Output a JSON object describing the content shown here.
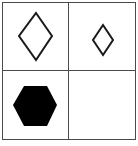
{
  "puzzle": {
    "layout": "2x2 grid",
    "cells": [
      {
        "position": "top-left",
        "shape": "diamond",
        "fill": "none",
        "size": "large"
      },
      {
        "position": "top-right",
        "shape": "diamond",
        "fill": "none",
        "size": "small"
      },
      {
        "position": "bottom-left",
        "shape": "hexagon",
        "fill": "black",
        "size": "large"
      },
      {
        "position": "bottom-right",
        "shape": "empty",
        "fill": "none",
        "size": ""
      }
    ],
    "colors": {
      "stroke": "#1a1a1a",
      "fill": "#000000",
      "grid": "#4a4a4a",
      "background": "#ffffff"
    }
  }
}
